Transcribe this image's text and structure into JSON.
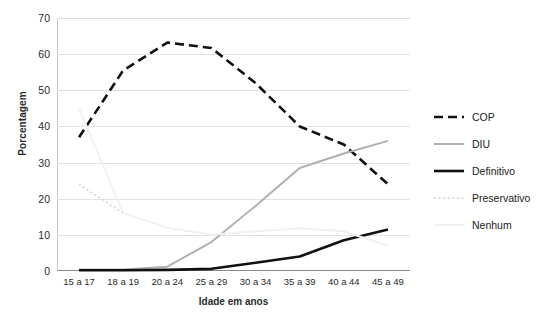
{
  "chart_data": {
    "type": "line",
    "title": "",
    "xlabel": "Idade em anos",
    "ylabel": "Porcentagem",
    "categories": [
      "15 a 17",
      "18 a 19",
      "20 a 24",
      "25 a 29",
      "30 a 34",
      "35 a 39",
      "40 a 44",
      "45 a 49"
    ],
    "ylim": [
      0,
      70
    ],
    "yticks": [
      0,
      10,
      20,
      30,
      40,
      50,
      60,
      70
    ],
    "grid": true,
    "legend_position": "right",
    "series": [
      {
        "name": "COP",
        "style": "dashed",
        "color": "#111111",
        "values": [
          37,
          55.5,
          63.2,
          61.7,
          52,
          40,
          35,
          24
        ]
      },
      {
        "name": "DIU",
        "style": "solid",
        "color": "#b0b0b0",
        "values": [
          0.4,
          0.4,
          1.2,
          8,
          18,
          28.5,
          32.5,
          36
        ]
      },
      {
        "name": "Definitivo",
        "style": "solid",
        "color": "#111111",
        "values": [
          0.2,
          0.2,
          0.3,
          0.6,
          2.3,
          4,
          8.5,
          11.5
        ]
      },
      {
        "name": "Preservativo",
        "style": "dotted",
        "color": "#d2d2d2",
        "values": [
          24,
          16,
          12,
          10,
          11,
          11.8,
          11,
          7
        ]
      },
      {
        "name": "Nenhum",
        "style": "solid",
        "color": "#f2f2f2",
        "values": [
          45,
          16,
          12,
          10,
          11,
          11.8,
          11,
          7
        ]
      }
    ]
  },
  "legend": {
    "items": [
      {
        "label": "COP"
      },
      {
        "label": "DIU"
      },
      {
        "label": "Definitivo"
      },
      {
        "label": "Preservativo"
      },
      {
        "label": "Nenhum"
      }
    ]
  }
}
